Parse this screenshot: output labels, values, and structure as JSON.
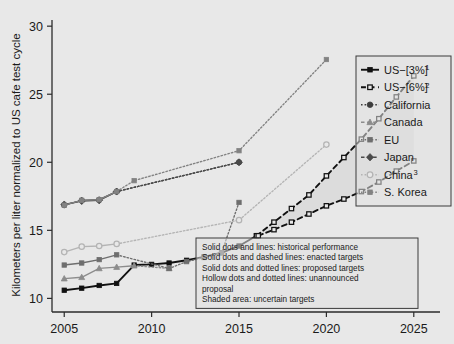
{
  "chart_data": {
    "type": "line",
    "title": "",
    "xlabel": "",
    "ylabel": "Kilometers per liter normalized to US cafe test cycle",
    "xlim": [
      2004.3,
      2026.5
    ],
    "ylim": [
      9.0,
      30.6
    ],
    "xticks": [
      2005,
      2010,
      2015,
      2020,
      2025
    ],
    "yticks": [
      10,
      15,
      20,
      25,
      30
    ],
    "xtick_labels": [
      "2005",
      "2010",
      "2015",
      "2020",
      "2025"
    ],
    "ytick_labels": [
      "10",
      "15",
      "20",
      "25",
      "30"
    ],
    "grid": false,
    "legend_position": "right",
    "series": [
      {
        "name": "US−[3%]",
        "superscript": "1",
        "color": "#111111",
        "marker": "square",
        "marker_filled": true,
        "legend_line": "solid",
        "segments": [
          {
            "style": "solid",
            "x": [
              2005,
              2006,
              2007,
              2008,
              2009,
              2010,
              2011,
              2012,
              2013,
              2014,
              2015,
              2016
            ],
            "y": [
              10.6,
              10.75,
              10.95,
              11.1,
              12.45,
              12.5,
              12.6,
              12.8,
              13.05,
              13.35,
              13.85,
              14.6
            ]
          }
        ]
      },
      {
        "name": "US−[6%]",
        "superscript": "2",
        "color": "#111111",
        "marker": "square",
        "marker_filled": false,
        "legend_line": "dashed",
        "segments": [
          {
            "style": "dashed",
            "x": [
              2016,
              2017,
              2018,
              2019,
              2020,
              2021,
              2022,
              2023,
              2024,
              2025
            ],
            "y": [
              14.6,
              15.6,
              16.6,
              17.6,
              19.0,
              20.35,
              21.7,
              23.2,
              24.8,
              26.35
            ]
          },
          {
            "style": "dashed",
            "x": [
              2016.1,
              2017,
              2018,
              2019,
              2020,
              2021,
              2022,
              2023,
              2024,
              2025
            ],
            "y": [
              14.6,
              15.05,
              15.6,
              16.2,
              16.8,
              17.3,
              17.85,
              18.55,
              19.35,
              20.1
            ]
          }
        ]
      },
      {
        "name": "California",
        "color": "#3d3d3d",
        "marker": "circle",
        "marker_filled": true,
        "legend_line": "dotted",
        "segments": [
          {
            "style": "solid",
            "x": [
              2005,
              2006,
              2007,
              2008
            ],
            "y": [
              16.85,
              17.2,
              17.25,
              17.85
            ]
          },
          {
            "style": "dotted",
            "x": [
              2008,
              2015
            ],
            "y": [
              17.85,
              20.0
            ]
          }
        ]
      },
      {
        "name": "Canada",
        "color": "#8c8c8c",
        "marker": "triangle",
        "marker_filled": true,
        "legend_line": "dashed",
        "segments": [
          {
            "style": "solid",
            "x": [
              2005,
              2006,
              2007,
              2008,
              2009
            ],
            "y": [
              11.45,
              11.55,
              12.2,
              12.3,
              12.4
            ]
          },
          {
            "style": "dotted",
            "x": [
              2009,
              2011
            ],
            "y": [
              12.4,
              12.2
            ]
          }
        ]
      },
      {
        "name": "EU",
        "color": "#6e6e6e",
        "marker": "square",
        "marker_filled": true,
        "legend_line": "dotted",
        "segments": [
          {
            "style": "solid",
            "x": [
              2005,
              2006,
              2007,
              2008
            ],
            "y": [
              12.45,
              12.6,
              12.85,
              13.2
            ]
          },
          {
            "style": "dotted",
            "x": [
              2008,
              2011,
              2012,
              2013,
              2014,
              2015
            ],
            "y": [
              13.2,
              12.2,
              12.7,
              13.0,
              13.35,
              17.05
            ]
          }
        ]
      },
      {
        "name": "Japan",
        "color": "#4a4a4a",
        "marker": "diamond",
        "marker_filled": true,
        "legend_line": "dashed",
        "segments": [
          {
            "style": "solid",
            "x": [
              2005,
              2006,
              2007,
              2008
            ],
            "y": [
              16.9,
              17.15,
              17.2,
              17.85
            ]
          },
          {
            "style": "dotted",
            "x": [
              2008,
              2015
            ],
            "y": [
              17.85,
              20.0
            ]
          }
        ]
      },
      {
        "name": "China",
        "superscript": "3",
        "color": "#b4b4b4",
        "marker": "circle",
        "marker_filled": false,
        "legend_line": "dotted",
        "segments": [
          {
            "style": "solid",
            "x": [
              2005,
              2006,
              2007,
              2008
            ],
            "y": [
              13.4,
              13.8,
              13.85,
              14.0
            ]
          },
          {
            "style": "dotted",
            "x": [
              2008,
              2015,
              2020
            ],
            "y": [
              14.0,
              15.75,
              21.3
            ]
          }
        ]
      },
      {
        "name": "S. Korea",
        "color": "#828282",
        "marker": "square",
        "marker_filled": true,
        "legend_line": "dotted",
        "segments": [
          {
            "style": "solid",
            "x": [
              2005,
              2006,
              2007,
              2008
            ],
            "y": [
              16.85,
              17.2,
              17.25,
              17.85
            ]
          },
          {
            "style": "dotted",
            "x": [
              2008,
              2009,
              2015,
              2020
            ],
            "y": [
              17.85,
              18.65,
              20.85,
              27.55
            ]
          }
        ]
      }
    ]
  },
  "legend": {
    "items": [
      {
        "label": "US−[3%]",
        "sup": "1"
      },
      {
        "label": "US−[6%]",
        "sup": "2"
      },
      {
        "label": "California",
        "sup": ""
      },
      {
        "label": "Canada",
        "sup": ""
      },
      {
        "label": "EU",
        "sup": ""
      },
      {
        "label": "Japan",
        "sup": ""
      },
      {
        "label": "China",
        "sup": "3"
      },
      {
        "label": "S. Korea",
        "sup": ""
      }
    ]
  },
  "notes": {
    "lines": [
      "Solid dots and lines: historical performance",
      "Solid dots and dashed lines: enacted targets",
      "Solid dots and dotted lines: proposed targets",
      "Hollow dots and dotted lines: unannounced",
      "proposal",
      "Shaded area: uncertain targets"
    ]
  },
  "axes": {
    "y_title": "Kilometers per liter normalized to US cafe test cycle",
    "x_tick_labels": [
      "2005",
      "2010",
      "2015",
      "2020",
      "2025"
    ],
    "y_tick_labels": [
      "10",
      "15",
      "20",
      "25",
      "30"
    ]
  },
  "colors": {
    "background": "#e8e8e8",
    "axis": "#2b2b2b",
    "text": "#1a1a1a"
  }
}
